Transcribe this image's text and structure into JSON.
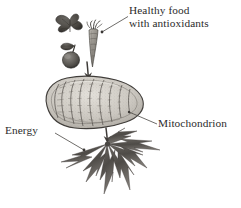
{
  "figure": {
    "background_color": "#ffffff",
    "ink_color": "#2b2b2b",
    "labels": {
      "healthy_food_line1": "Healthy food",
      "healthy_food_line2": "with antioxidants",
      "mitochondrion": "Mitochondrion",
      "energy": "Energy"
    },
    "elements": {
      "leafy_greens": "leafy-greens-icon",
      "apple": "apple-icon",
      "carrot": "carrot-icon",
      "mitochondrion": "mitochondrion-icon",
      "energy_burst": "energy-burst-icon",
      "arrow_food_to_mito": "down-arrow-icon",
      "arrow_mito_to_energy": "down-arrow-icon",
      "leader_healthy_food": "leader-line",
      "leader_mitochondrion": "leader-line",
      "leader_energy": "leader-line"
    },
    "colors": {
      "ink": "#2b2b2b",
      "organelle_fill": "#cfcbc4",
      "organelle_outline": "#4a4744",
      "cristae": "#8c8880",
      "burst": "#585450",
      "produce_dark": "#4f4c48",
      "background": "#ffffff"
    }
  }
}
